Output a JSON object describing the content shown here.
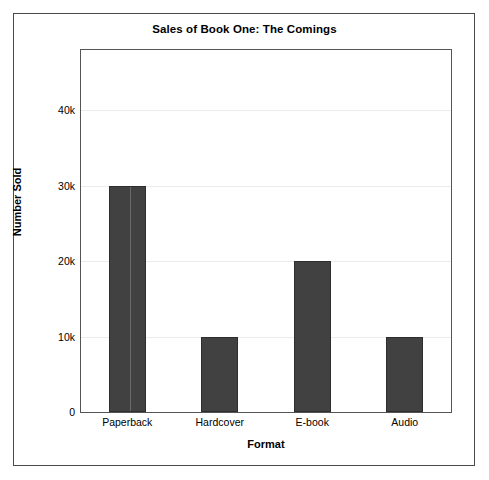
{
  "chart_data": {
    "type": "bar",
    "title": "Sales of Book One: The Comings",
    "xlabel": "Format",
    "ylabel": "Number Sold",
    "categories": [
      "Paperback",
      "Hardcover",
      "E-book",
      "Audio"
    ],
    "values": [
      30000,
      10000,
      20000,
      10000
    ],
    "ytick_labels": [
      "0",
      "10k",
      "20k",
      "30k",
      "40k"
    ],
    "ytick_values": [
      0,
      10000,
      20000,
      30000,
      40000
    ],
    "ylim": [
      0,
      48000
    ],
    "grid": "horizontal",
    "legend": "none",
    "bar_color": "#414141",
    "grid_color": "#ebebeb",
    "axis_color": "#555555",
    "background": "#ffffff"
  }
}
